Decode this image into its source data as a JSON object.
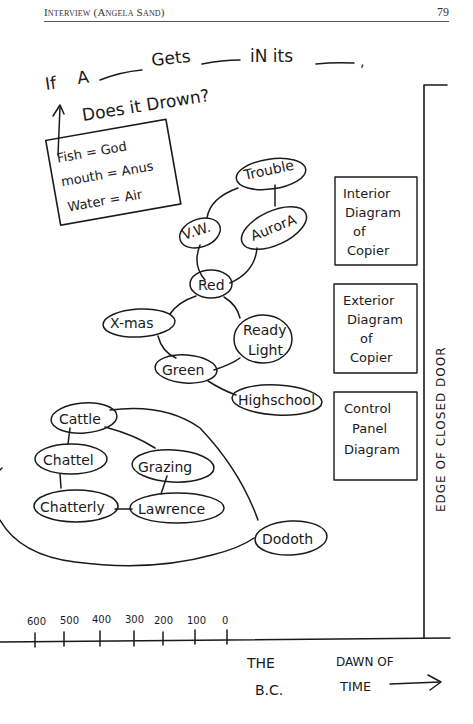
{
  "header": {
    "title": "Interview (Angela Sand)",
    "page_number": "79"
  },
  "riddle": {
    "line1_words": [
      "If",
      "A",
      "Gets",
      "iN its"
    ],
    "line1_end": ",",
    "line2": "Does it Drown?"
  },
  "legend_box": {
    "lines": [
      "Fish = God",
      "mouth = Anus",
      "Water = Air"
    ]
  },
  "nodes": {
    "trouble": "Trouble",
    "vw": "V.W.",
    "aurora": "AurorA",
    "red": "Red",
    "xmas": "X-mas",
    "ready_light_1": "Ready",
    "ready_light_2": "Light",
    "green": "Green",
    "highschool": "Highschool",
    "cattle": "Cattle",
    "chattel": "Chattel",
    "grazing": "Grazing",
    "chatterly": "Chatterly",
    "lawrence": "Lawrence",
    "dodoth": "Dodoth"
  },
  "side_boxes": [
    {
      "lines": [
        "Interior",
        "Diagram",
        "of",
        "Copier"
      ]
    },
    {
      "lines": [
        "Exterior",
        "Diagram",
        "of",
        "Copier"
      ]
    },
    {
      "lines": [
        "Control",
        "Panel",
        "Diagram"
      ]
    }
  ],
  "door_label": "EDGE OF CLOSED DOOR",
  "timeline": {
    "ticks": [
      "600",
      "500",
      "400",
      "300",
      "200",
      "100",
      "0"
    ],
    "label_bc_1": "THE",
    "label_bc_2": "B.C.",
    "label_dawn_1": "DAWN OF",
    "label_dawn_2": "TIME"
  }
}
